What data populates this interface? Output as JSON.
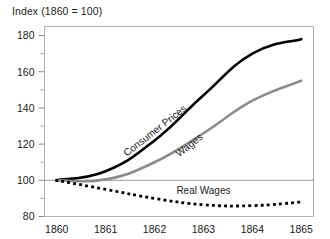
{
  "chart_data": {
    "type": "line",
    "title": "Index (1860 = 100)",
    "xlabel": "",
    "ylabel": "",
    "x": [
      1860,
      1861,
      1862,
      1863,
      1864,
      1865
    ],
    "xtick_labels": [
      "1860",
      "1861",
      "1862",
      "1863",
      "1864",
      "1865"
    ],
    "ytick_labels": [
      "80",
      "100",
      "120",
      "140",
      "160",
      "180"
    ],
    "ytick_values": [
      80,
      100,
      120,
      140,
      160,
      180
    ],
    "yminor_values": [
      90,
      110,
      130,
      150,
      170
    ],
    "ylim": [
      80,
      185
    ],
    "xlim": [
      1859.75,
      1865.25
    ],
    "grid": false,
    "reference_line": 100,
    "legend_position": "inline-annotations",
    "series": [
      {
        "name": "Consumer Prices",
        "color": "#000000",
        "style": "solid",
        "width": 2.6,
        "values": [
          100,
          105,
          122,
          147,
          170,
          178
        ],
        "label_anchor": {
          "x": 1862.05,
          "y": 126,
          "rotation": -38
        }
      },
      {
        "name": "Wages",
        "color": "#8c8c8c",
        "style": "solid",
        "width": 2.6,
        "values": [
          100,
          100.5,
          110,
          126,
          144,
          155
        ],
        "label_anchor": {
          "x": 1862.75,
          "y": 118,
          "rotation": -38
        }
      },
      {
        "name": "Real Wages",
        "color": "#000000",
        "style": "dotted",
        "width": 2.8,
        "values": [
          100,
          95,
          90,
          86.5,
          86,
          88
        ],
        "label_anchor": {
          "x": 1863.0,
          "y": 92.5,
          "rotation": 0
        }
      }
    ]
  }
}
